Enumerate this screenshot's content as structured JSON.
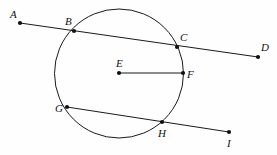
{
  "figure": {
    "width": 277,
    "height": 155,
    "background_color": "#fefefe",
    "stroke_color": "#1a1a1a",
    "point_color": "#111111"
  },
  "circle": {
    "name": "circle-E",
    "center_label": "E",
    "center_x": 119,
    "center_y": 73.5,
    "radius": 64.5,
    "stroke_width": 1
  },
  "points": [
    {
      "id": "A",
      "label": "A",
      "x": 20,
      "y": 23,
      "on_circle": false,
      "label_dx": -10,
      "label_dy": -14
    },
    {
      "id": "B",
      "label": "B",
      "x": 74,
      "y": 31,
      "on_circle": true,
      "label_dx": -9,
      "label_dy": -15
    },
    {
      "id": "C",
      "label": "C",
      "x": 177,
      "y": 47,
      "on_circle": true,
      "label_dx": 3,
      "label_dy": -15
    },
    {
      "id": "D",
      "label": "D",
      "x": 258,
      "y": 57,
      "on_circle": false,
      "label_dx": 3,
      "label_dy": -15
    },
    {
      "id": "E",
      "label": "E",
      "x": 119,
      "y": 73,
      "on_circle": false,
      "label_dx": -3,
      "label_dy": -15
    },
    {
      "id": "F",
      "label": "F",
      "x": 183,
      "y": 73,
      "on_circle": true,
      "label_dx": 4,
      "label_dy": -4
    },
    {
      "id": "G",
      "label": "G",
      "x": 67,
      "y": 107,
      "on_circle": true,
      "label_dx": -12,
      "label_dy": -4
    },
    {
      "id": "H",
      "label": "H",
      "x": 162,
      "y": 122,
      "on_circle": true,
      "label_dx": -4,
      "label_dy": 6
    },
    {
      "id": "I",
      "label": "I",
      "x": 229,
      "y": 132,
      "on_circle": false,
      "label_dx": -2,
      "label_dy": 6
    }
  ],
  "segments": [
    {
      "name": "secant-line-AD",
      "from": "A",
      "to": "D",
      "x1": 20,
      "y1": 23,
      "x2": 258,
      "y2": 57,
      "kind": "secant"
    },
    {
      "name": "radius-segment-EF",
      "from": "E",
      "to": "F",
      "x1": 119,
      "y1": 73,
      "x2": 183,
      "y2": 73,
      "kind": "radius"
    },
    {
      "name": "secant-line-GI",
      "from": "G",
      "to": "I",
      "x1": 67,
      "y1": 107,
      "x2": 229,
      "y2": 132,
      "kind": "secant"
    }
  ],
  "point_marker": {
    "radius": 2.1
  }
}
